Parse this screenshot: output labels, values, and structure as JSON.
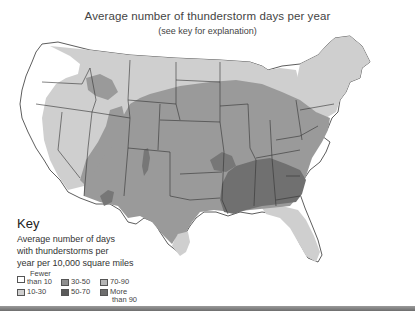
{
  "header": {
    "title": "Average number of thunderstorm days per year",
    "subtitle": "(see key for explanation)"
  },
  "key": {
    "title": "Key",
    "description_lines": [
      "Average number of days",
      "with thunderstorms per",
      "year per 10,000 square miles"
    ]
  },
  "legend": [
    {
      "label": "Fewer than 10",
      "lines": [
        "Fewer",
        "than 10"
      ],
      "color": "#ffffff"
    },
    {
      "label": "10-30",
      "lines": [
        "10-30"
      ],
      "color": "#cfcfcf"
    },
    {
      "label": "30-50",
      "lines": [
        "30-50"
      ],
      "color": "#8f8f8f"
    },
    {
      "label": "50-70",
      "lines": [
        "50-70"
      ],
      "color": "#5a5a5a"
    },
    {
      "label": "70-90",
      "lines": [
        "70-90"
      ],
      "color": "#b5b5b5"
    },
    {
      "label": "More than 90",
      "lines": [
        "More",
        "than 90"
      ],
      "color": "#6e6e6e"
    }
  ],
  "map": {
    "region": "Contiguous United States",
    "colors": {
      "fewer_than_10": "#ffffff",
      "10_30": "#cfcfcf",
      "30_50": "#9a9a9a",
      "50_70": "#707070",
      "border": "#333333"
    }
  }
}
